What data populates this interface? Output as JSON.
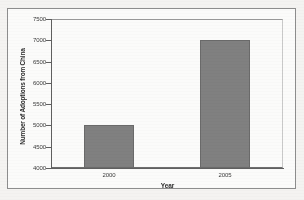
{
  "chart_data": {
    "type": "bar",
    "title": "",
    "xlabel": "Year",
    "ylabel": "Number of Adoptions from China",
    "categories": [
      "2000",
      "2005"
    ],
    "values": [
      5000,
      7000
    ],
    "ylim": [
      4000,
      7500
    ],
    "yticks": [
      4000,
      4500,
      5000,
      5500,
      6000,
      6500,
      7000,
      7500
    ],
    "ytick_labels": [
      "4000",
      "4500",
      "5000",
      "5500",
      "6000",
      "6500",
      "7000",
      "7500"
    ],
    "xtick_labels": [
      "2000",
      "2005"
    ],
    "grid": false,
    "legend": false,
    "bar_color": "#808080",
    "bar_edge_color": "#6a6a6a",
    "plot_background": "#fbfbfa",
    "axis_color": "#5f5f5f",
    "figure_background": "#f4f3f1"
  }
}
